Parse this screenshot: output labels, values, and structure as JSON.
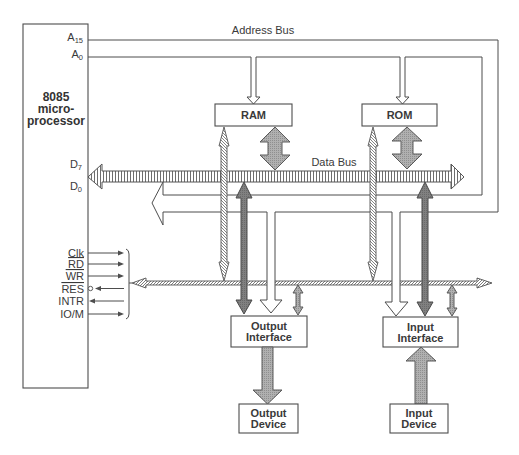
{
  "diagram": {
    "processor": {
      "line1": "8085",
      "line2": "micro-",
      "line3": "processor"
    },
    "address_pins": {
      "high": {
        "base": "A",
        "sub": "15"
      },
      "low": {
        "base": "A",
        "sub": "0"
      }
    },
    "data_pins": {
      "high": {
        "base": "D",
        "sub": "7"
      },
      "low": {
        "base": "D",
        "sub": "0"
      }
    },
    "bus_labels": {
      "address": "Address Bus",
      "data": "Data Bus"
    },
    "control_signals": [
      {
        "label": "Clk",
        "active_low": false,
        "direction": "out"
      },
      {
        "label": "RD",
        "active_low": true,
        "direction": "out"
      },
      {
        "label": "WR",
        "active_low": true,
        "direction": "out"
      },
      {
        "label": "RES",
        "active_low": true,
        "direction": "in",
        "inversion_bubble": true
      },
      {
        "label": "INTR",
        "active_low": false,
        "direction": "in"
      },
      {
        "label": "IO/M",
        "active_low": false,
        "direction": "out"
      }
    ],
    "blocks": {
      "ram": "RAM",
      "rom": "ROM",
      "output_interface": {
        "line1": "Output",
        "line2": "Interface"
      },
      "input_interface": {
        "line1": "Input",
        "line2": "Interface"
      },
      "output_device": {
        "line1": "Output",
        "line2": "Device"
      },
      "input_device": {
        "line1": "Input",
        "line2": "Device"
      }
    },
    "colors": {
      "line": "#4d4d4d",
      "text": "#3a3a3a",
      "data_path_fill": "#a9a9a9",
      "bus_transfer_fill": "#7a7a7a",
      "background": "#ffffff"
    }
  }
}
